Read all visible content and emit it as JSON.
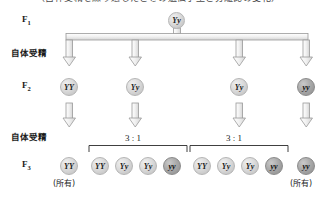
{
  "figure": {
    "caption_cropped": "（自体受精を繰り返したときの遺伝子型と分離比の変化）",
    "rows": [
      {
        "id": "F1",
        "label": "F",
        "sub": "1"
      },
      {
        "id": "F2",
        "label": "F",
        "sub": "2"
      },
      {
        "id": "F3",
        "label": "F",
        "sub": "3"
      }
    ],
    "process_labels": [
      {
        "id": "selfing-1",
        "text": "自体受精"
      },
      {
        "id": "selfing-2",
        "text": "自体受精"
      }
    ],
    "f1": {
      "genotypes": [
        {
          "text": "Yy",
          "shade": "light"
        }
      ]
    },
    "f2": {
      "genotypes": [
        {
          "text": "YY",
          "shade": "light"
        },
        {
          "text": "Yy",
          "shade": "light"
        },
        {
          "text": "Yy",
          "shade": "light"
        },
        {
          "text": "yy",
          "shade": "dark"
        }
      ]
    },
    "f3": {
      "genotypes": [
        {
          "text": "YY",
          "shade": "light"
        },
        {
          "text": "YY",
          "shade": "light"
        },
        {
          "text": "Yy",
          "shade": "light"
        },
        {
          "text": "Yy",
          "shade": "light"
        },
        {
          "text": "yy",
          "shade": "dark"
        },
        {
          "text": "YY",
          "shade": "light"
        },
        {
          "text": "Yy",
          "shade": "light"
        },
        {
          "text": "Yy",
          "shade": "light"
        },
        {
          "text": "yy",
          "shade": "dark"
        },
        {
          "text": "yy",
          "shade": "dark"
        }
      ],
      "annotations": [
        {
          "id": "all-left",
          "text": "(所有)"
        },
        {
          "id": "all-right",
          "text": "(所有)"
        }
      ],
      "ratios": [
        {
          "id": "ratio-left",
          "text": "3 : 1"
        },
        {
          "id": "ratio-right",
          "text": "3 : 1"
        }
      ]
    },
    "colors": {
      "stroke": "#9a9a9a",
      "arrow_fill": "#efefef",
      "text": "#1a1a1a",
      "dark_circle": "#9a9a9a",
      "light_circle": "#d8d8d8"
    }
  }
}
